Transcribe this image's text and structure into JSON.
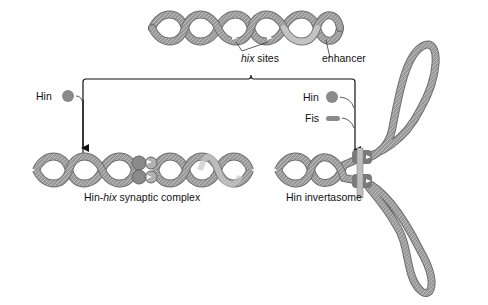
{
  "labels": {
    "hix_sites_italic": "hix",
    "hix_sites_rest": " sites",
    "enhancer": "enhancer",
    "hin_left": "Hin",
    "hin_right": "Hin",
    "fis": "Fis",
    "complex_prefix": "Hin-",
    "complex_italic": "hix",
    "complex_rest": " synaptic complex",
    "invertasome": "Hin invertasome"
  },
  "colors": {
    "dna": "#9a9a9a",
    "dna_dark": "#6e6e6e",
    "enhancer": "#bdbdbd",
    "protein": "#8a8a8a",
    "arrow": "#111111"
  }
}
